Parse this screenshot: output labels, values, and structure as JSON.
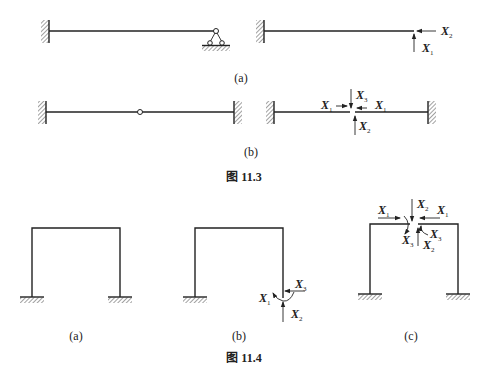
{
  "figure_11_3": {
    "caption": "图 11.3",
    "sub_a": {
      "label": "(a)",
      "left_structure": "fixed-end beam with pin-roller support",
      "right_forces": [
        {
          "name": "X",
          "sub": "2"
        },
        {
          "name": "X",
          "sub": "1"
        }
      ]
    },
    "sub_b": {
      "label": "(b)",
      "left_structure": "fixed-fixed beam with intermediate hinge",
      "right_forces": [
        {
          "name": "X",
          "sub": "1"
        },
        {
          "name": "X",
          "sub": "3"
        },
        {
          "name": "X",
          "sub": "1"
        },
        {
          "name": "X",
          "sub": "2"
        }
      ]
    }
  },
  "figure_11_4": {
    "caption": "图 11.4",
    "sub_a": {
      "label": "(a)"
    },
    "sub_b": {
      "label": "(b)",
      "forces": [
        {
          "name": "X",
          "sub": "3"
        },
        {
          "name": "X",
          "sub": "1"
        },
        {
          "name": "X",
          "sub": "2"
        }
      ]
    },
    "sub_c": {
      "label": "(c)",
      "forces": [
        {
          "name": "X",
          "sub": "1"
        },
        {
          "name": "X",
          "sub": "2"
        },
        {
          "name": "X",
          "sub": "1"
        },
        {
          "name": "X",
          "sub": "3"
        },
        {
          "name": "X",
          "sub": "3"
        },
        {
          "name": "X",
          "sub": "2"
        }
      ]
    }
  }
}
